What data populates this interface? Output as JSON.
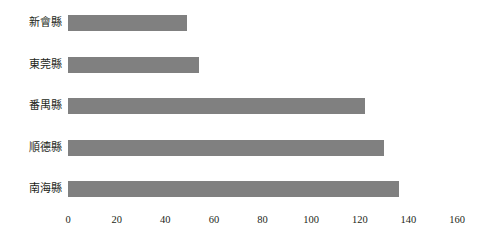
{
  "chart_data": {
    "type": "bar",
    "orientation": "horizontal",
    "title": "",
    "xlabel": "",
    "ylabel": "",
    "categories": [
      "新會縣",
      "東莞縣",
      "番禺縣",
      "順德縣",
      "南海縣"
    ],
    "values": [
      49,
      54,
      122,
      130,
      136
    ],
    "xlim": [
      0,
      160
    ],
    "xticks": [
      0,
      20,
      40,
      60,
      80,
      100,
      120,
      140,
      160
    ],
    "xtick_labels": [
      "0",
      "20",
      "40",
      "60",
      "80",
      "100",
      "120",
      "140",
      "160"
    ],
    "grid": false,
    "legend": null,
    "bar_color": "#808080",
    "background_color": "#ffffff",
    "text_color": "#231f20"
  }
}
